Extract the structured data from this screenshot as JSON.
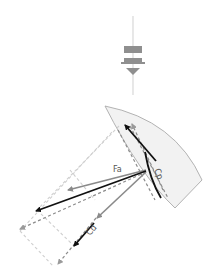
{
  "diagram": {
    "wind_indicator": {
      "icon": "wind-direction-icon",
      "color": "#999999",
      "line_color": "#d8d8d8"
    },
    "sail": {
      "fill": "#f2f2f2",
      "stroke": "#aaaaaa"
    },
    "labels": {
      "fa": "Fa",
      "cp": "Cp",
      "cd": "Cd"
    },
    "colors": {
      "primary_vector": "#111111",
      "secondary_vector": "#8a8a8a",
      "dashed_dark": "#8c8c8c",
      "dashed_light": "#cfcfcf"
    }
  }
}
